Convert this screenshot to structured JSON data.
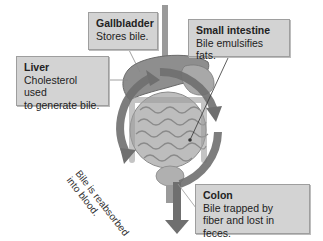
{
  "diagram": {
    "colors": {
      "label_background": "#d3d3d3",
      "label_border": "#9e9e9e",
      "arrow": "#6f6f6f",
      "organs": "#b8b8b8",
      "liver": "#8e8e8e"
    },
    "labels": {
      "gallbladder": {
        "title": "Gallbladder",
        "desc": "Stores bile."
      },
      "liver": {
        "title": "Liver",
        "desc_line1": "Cholesterol used",
        "desc_line2": "to generate bile."
      },
      "small_intestine": {
        "title": "Small intestine",
        "desc": "Bile emulsifies fats."
      },
      "colon": {
        "title": "Colon",
        "desc_line1": "Bile trapped by",
        "desc_line2": "fiber and lost in feces."
      }
    },
    "arrow_text": {
      "line1": "Bile is reabsorbed",
      "line2": "into blood."
    }
  }
}
